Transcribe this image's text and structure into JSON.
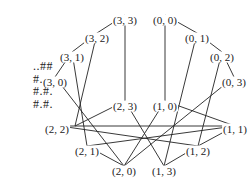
{
  "grid": {
    "rows": [
      "..##",
      "#...",
      "#.#.",
      "#.#."
    ]
  },
  "nodes": [
    {
      "id": "33",
      "label": "(3, 3)",
      "x": 125,
      "y": 20
    },
    {
      "id": "00",
      "label": "(0, 0)",
      "x": 165,
      "y": 20
    },
    {
      "id": "32",
      "label": "(3, 2)",
      "x": 97,
      "y": 38
    },
    {
      "id": "01",
      "label": "(0, 1)",
      "x": 197,
      "y": 38
    },
    {
      "id": "31",
      "label": "(3, 1)",
      "x": 72,
      "y": 57
    },
    {
      "id": "02",
      "label": "(0, 2)",
      "x": 222,
      "y": 57
    },
    {
      "id": "30",
      "label": "(3, 0)",
      "x": 55,
      "y": 82
    },
    {
      "id": "03",
      "label": "(0, 3)",
      "x": 234,
      "y": 82
    },
    {
      "id": "23",
      "label": "(2, 3)",
      "x": 125,
      "y": 106
    },
    {
      "id": "10",
      "label": "(1, 0)",
      "x": 165,
      "y": 106
    },
    {
      "id": "22",
      "label": "(2, 2)",
      "x": 57,
      "y": 129
    },
    {
      "id": "11",
      "label": "(1, 1)",
      "x": 235,
      "y": 129
    },
    {
      "id": "21",
      "label": "(2, 1)",
      "x": 87,
      "y": 151
    },
    {
      "id": "12",
      "label": "(1, 2)",
      "x": 198,
      "y": 151
    },
    {
      "id": "20",
      "label": "(2, 0)",
      "x": 124,
      "y": 171
    },
    {
      "id": "13",
      "label": "(1, 3)",
      "x": 164,
      "y": 171
    }
  ],
  "edges": [
    [
      125,
      15,
      97,
      33
    ],
    [
      125,
      15,
      125,
      101
    ],
    [
      97,
      33,
      72,
      52
    ],
    [
      97,
      33,
      75,
      126
    ],
    [
      72,
      52,
      55,
      77
    ],
    [
      72,
      52,
      87,
      146
    ],
    [
      55,
      77,
      124,
      166
    ],
    [
      165,
      15,
      197,
      33
    ],
    [
      165,
      15,
      165,
      101
    ],
    [
      197,
      33,
      222,
      52
    ],
    [
      197,
      33,
      164,
      166
    ],
    [
      222,
      52,
      234,
      77
    ],
    [
      222,
      52,
      198,
      146
    ],
    [
      234,
      77,
      124,
      166
    ],
    [
      125,
      101,
      75,
      126
    ],
    [
      125,
      101,
      164,
      166
    ],
    [
      165,
      101,
      235,
      126
    ],
    [
      165,
      101,
      124,
      166
    ],
    [
      60,
      126,
      235,
      126
    ],
    [
      60,
      126,
      198,
      146
    ],
    [
      87,
      146,
      124,
      166
    ],
    [
      87,
      146,
      235,
      126
    ],
    [
      198,
      146,
      164,
      166
    ],
    [
      198,
      146,
      235,
      126
    ]
  ]
}
